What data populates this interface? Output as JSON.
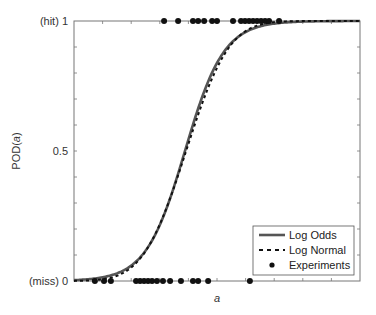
{
  "chart_data": {
    "type": "line",
    "title": "",
    "xlabel": "a",
    "ylabel": "POD(a)",
    "ylim": [
      0,
      1
    ],
    "xlim": [
      0,
      1
    ],
    "grid": false,
    "legend_position": "lower right",
    "y_ticks": [
      {
        "value": 0,
        "label": "(miss) 0"
      },
      {
        "value": 0.5,
        "label": "0.5"
      },
      {
        "value": 1,
        "label": "(hit) 1"
      }
    ],
    "series": [
      {
        "name": "Log Odds",
        "style": "solid",
        "color": "#555555",
        "model": "logistic",
        "center": 0.388,
        "scale": 0.068
      },
      {
        "name": "Log Normal",
        "style": "dashed",
        "color": "#111111",
        "model": "normal-cdf",
        "center": 0.392,
        "scale": 0.118
      },
      {
        "name": "Experiments",
        "style": "markers",
        "color": "#111111",
        "hits_x": [
          0.315,
          0.364,
          0.416,
          0.434,
          0.455,
          0.483,
          0.5,
          0.556,
          0.584,
          0.598,
          0.612,
          0.626,
          0.64,
          0.654,
          0.668,
          0.682,
          0.717
        ],
        "misses_x": [
          0.073,
          0.105,
          0.129,
          0.217,
          0.231,
          0.245,
          0.259,
          0.273,
          0.29,
          0.311,
          0.336,
          0.374,
          0.416,
          0.434,
          0.469,
          0.615
        ]
      }
    ]
  },
  "axes": {
    "xlabel": "a",
    "ylabel_prefix": "POD(",
    "ylabel_var": "a",
    "ylabel_suffix": ")",
    "ytick_top": "(hit) 1",
    "ytick_mid": "0.5",
    "ytick_bottom": "(miss) 0"
  },
  "legend": {
    "items": [
      {
        "label": "Log Odds"
      },
      {
        "label": "Log Normal"
      },
      {
        "label": "Experiments"
      }
    ]
  }
}
